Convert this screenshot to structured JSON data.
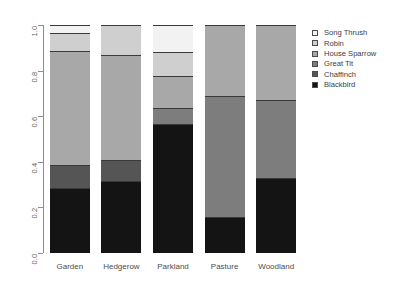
{
  "chart_data": {
    "type": "bar",
    "stacked": true,
    "normalized": true,
    "title": "",
    "subtitle": "",
    "xlabel": "",
    "ylabel": "",
    "categories": [
      "Garden",
      "Hedgerow",
      "Parkland",
      "Pasture",
      "Woodland"
    ],
    "ylim": [
      0.0,
      1.0
    ],
    "ytick_labels": [
      "0.0",
      "0.2",
      "0.4",
      "0.6",
      "0.8",
      "1.0"
    ],
    "ytick_values": [
      0.0,
      0.2,
      0.4,
      0.6,
      0.8,
      1.0
    ],
    "grid": false,
    "legend_position": "top-right",
    "series": [
      {
        "name": "Blackbird",
        "color": "#141414",
        "values": [
          0.285,
          0.315,
          0.565,
          0.16,
          0.33
        ]
      },
      {
        "name": "Chaffinch",
        "color": "#555555",
        "values": [
          0.1,
          0.095,
          0.0,
          0.0,
          0.0
        ]
      },
      {
        "name": "Great Tit",
        "color": "#7d7d7d",
        "values": [
          0.0,
          0.0,
          0.07,
          0.53,
          0.34
        ]
      },
      {
        "name": "House Sparrow",
        "color": "#a8a8a8",
        "values": [
          0.5,
          0.46,
          0.14,
          0.31,
          0.33
        ]
      },
      {
        "name": "Robin",
        "color": "#cfcfcf",
        "values": [
          0.08,
          0.13,
          0.105,
          0.0,
          0.0
        ]
      },
      {
        "name": "Song Thrush",
        "color": "#f2f2f2",
        "values": [
          0.035,
          0.0,
          0.12,
          0.0,
          0.0
        ]
      }
    ],
    "legend_entries": [
      {
        "label": "Song Thrush",
        "color": "#f2f2f2"
      },
      {
        "label": "Robin",
        "color": "#cfcfcf"
      },
      {
        "label": "House Sparrow",
        "color": "#a8a8a8"
      },
      {
        "label": "Great Tit",
        "color": "#7d7d7d"
      },
      {
        "label": "Chaffinch",
        "color": "#555555"
      },
      {
        "label": "Blackbird",
        "color": "#141414"
      }
    ]
  }
}
